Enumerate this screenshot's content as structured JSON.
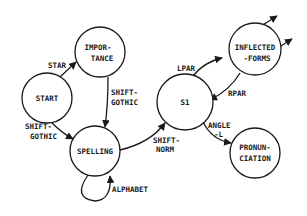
{
  "diagram": {
    "type": "state-transition-diagram",
    "nodes": [
      {
        "id": "start",
        "label_lines": [
          "START"
        ]
      },
      {
        "id": "importance",
        "label_lines": [
          "IMPOR-",
          "TANCE"
        ]
      },
      {
        "id": "spelling",
        "label_lines": [
          "SPELLING"
        ]
      },
      {
        "id": "s1",
        "label_lines": [
          "S1"
        ]
      },
      {
        "id": "inflected_forms",
        "label_lines": [
          "INFLECTED",
          "-FORMS"
        ]
      },
      {
        "id": "pronunciation",
        "label_lines": [
          "PRONUN-",
          "CIATION"
        ]
      }
    ],
    "edges": [
      {
        "from": "start",
        "to": "importance",
        "label_lines": [
          "STAR"
        ]
      },
      {
        "from": "start",
        "to": "spelling",
        "label_lines": [
          "SHIFT-",
          "GOTHIC"
        ]
      },
      {
        "from": "importance",
        "to": "spelling",
        "label_lines": [
          "SHIFT-",
          "GOTHIC"
        ]
      },
      {
        "from": "spelling",
        "to": "spelling",
        "label_lines": [
          "ALPHABET"
        ]
      },
      {
        "from": "spelling",
        "to": "s1",
        "label_lines": [
          "SHIFT-",
          "NORM"
        ]
      },
      {
        "from": "s1",
        "to": "inflected_forms",
        "label_lines": [
          "LPAR"
        ]
      },
      {
        "from": "inflected_forms",
        "to": "s1",
        "label_lines": [
          "RPAR"
        ]
      },
      {
        "from": "s1",
        "to": "pronunciation",
        "label_lines": [
          "ANGLE",
          "-L"
        ]
      },
      {
        "from": "inflected_forms",
        "to": "(offscreen-1)",
        "label_lines": []
      },
      {
        "from": "inflected_forms",
        "to": "(offscreen-2)",
        "label_lines": []
      }
    ]
  },
  "nodes": {
    "start": {
      "l1": "START"
    },
    "importance": {
      "l1": "IMPOR-",
      "l2": "TANCE"
    },
    "spelling": {
      "l1": "SPELLING"
    },
    "s1": {
      "l1": "S1"
    },
    "inflected": {
      "l1": "INFLECTED",
      "l2": "-FORMS"
    },
    "pronunciation": {
      "l1": "PRONUN-",
      "l2": "CIATION"
    }
  },
  "edges": {
    "star": {
      "l1": "STAR"
    },
    "start_spelling": {
      "l1": "SHIFT-",
      "l2": "GOTHIC"
    },
    "importance_spelling": {
      "l1": "SHIFT-",
      "l2": "GOTHIC"
    },
    "alphabet": {
      "l1": "ALPHABET"
    },
    "shift_norm": {
      "l1": "SHIFT-",
      "l2": "NORM"
    },
    "lpar": {
      "l1": "LPAR"
    },
    "rpar": {
      "l1": "RPAR"
    },
    "angle_l": {
      "l1": "ANGLE",
      "l2": "-L"
    }
  },
  "colors": {
    "stroke": "#1a1a1a",
    "background": "#ffffff"
  }
}
